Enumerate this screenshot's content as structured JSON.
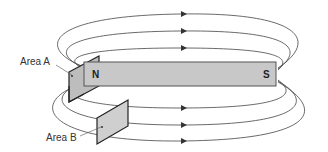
{
  "diagram": {
    "magnet": {
      "north_label": "N",
      "south_label": "S",
      "fill_color": "#c8c8c8",
      "stroke_color": "#555555"
    },
    "areas": [
      {
        "label": "Area A",
        "position": "at north pole, perpendicular to magnet"
      },
      {
        "label": "Area B",
        "position": "below magnet, among lower field lines"
      }
    ],
    "field_lines": {
      "upper_count": 3,
      "lower_count": 3,
      "arrow_direction": "right (outside magnet, N to S)",
      "color": "#444444"
    }
  }
}
